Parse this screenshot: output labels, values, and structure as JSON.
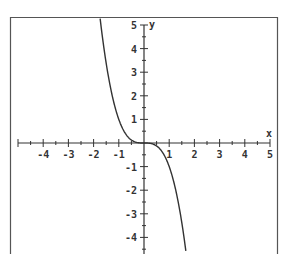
{
  "chart_data": {
    "type": "line",
    "title": "",
    "xlabel": "x",
    "ylabel": "y",
    "xlim": [
      -5,
      5
    ],
    "ylim": [
      -5,
      5
    ],
    "grid": false,
    "function": "y = -x^3",
    "x_ticks": [
      -4,
      -3,
      -2,
      -1,
      1,
      2,
      3,
      4,
      5
    ],
    "y_ticks": [
      5,
      4,
      3,
      2,
      1,
      -1,
      -2,
      -3,
      -4
    ],
    "x_tick_labels": [
      "-4",
      "-3",
      "-2",
      "-1",
      "1",
      "2",
      "3",
      "4",
      "5"
    ],
    "y_tick_labels": [
      "5",
      "4",
      "3",
      "2",
      "1",
      "-1",
      "-2",
      "-3",
      "-4"
    ],
    "series": [
      {
        "name": "y = -x^3",
        "x": [
          -1.7,
          -1.5,
          -1.25,
          -1.0,
          -0.75,
          -0.5,
          -0.25,
          0,
          0.25,
          0.5,
          0.75,
          1.0,
          1.25,
          1.5,
          1.7
        ],
        "y": [
          4.91,
          3.375,
          1.95,
          1.0,
          0.42,
          0.125,
          0.016,
          0,
          -0.016,
          -0.125,
          -0.42,
          -1.0,
          -1.95,
          -3.375,
          -4.91
        ]
      }
    ],
    "colors": {
      "axis": "#333333",
      "curve": "#333333",
      "frame": "#555555"
    }
  },
  "axes": {
    "x_label": "x",
    "y_label": "y"
  }
}
